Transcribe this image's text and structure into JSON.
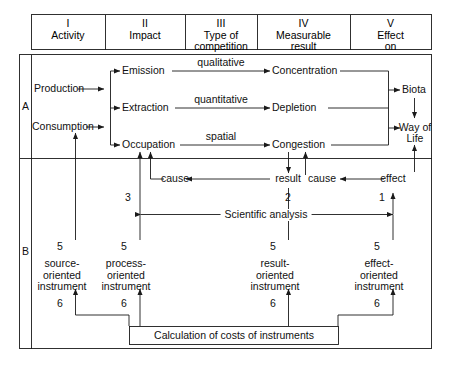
{
  "diagram": {
    "columns": [
      {
        "numeral": "I",
        "label": "Activity"
      },
      {
        "numeral": "II",
        "label": "Impact"
      },
      {
        "numeral": "III",
        "label": "Type of\ncompetition",
        "line1": "Type of",
        "line2": "competition"
      },
      {
        "numeral": "IV",
        "label": "Measurable\nresult",
        "line1": "Measurable",
        "line2": "result"
      },
      {
        "numeral": "V",
        "label": "Effect\non",
        "line1": "Effect",
        "line2": "on"
      }
    ],
    "sections": [
      {
        "key": "A",
        "label": "A"
      },
      {
        "key": "B",
        "label": "B"
      }
    ],
    "section_a": {
      "activities": [
        "Production",
        "Consumption"
      ],
      "impacts": [
        "Emission",
        "Extraction",
        "Occupation"
      ],
      "competition_types": [
        "qualitative",
        "quantitative",
        "spatial"
      ],
      "results": [
        "Concentration",
        "Depletion",
        "Congestion"
      ],
      "effects": [
        {
          "line1": "Biota",
          "line2": ""
        },
        {
          "line1": "Way of",
          "line2": "Life"
        }
      ]
    },
    "section_b": {
      "chain": [
        {
          "label": "cause",
          "column": "II"
        },
        {
          "label": "result",
          "column": "IV"
        },
        {
          "label": "cause",
          "column": "IV"
        },
        {
          "label": "effect",
          "column": "V"
        }
      ],
      "chain_numbers": [
        "3",
        "2",
        "1"
      ],
      "analysis_label": "Scientific analysis",
      "instrument_top_numbers": [
        "5",
        "5",
        "5",
        "5"
      ],
      "instrument_bottom_numbers": [
        "6",
        "6",
        "6",
        "6"
      ],
      "instruments": [
        {
          "line1": "source-",
          "line2": "oriented",
          "line3": "instrument"
        },
        {
          "line1": "process-",
          "line2": "oriented",
          "line3": "instrument"
        },
        {
          "line1": "result-",
          "line2": "oriented",
          "line3": "instrument"
        },
        {
          "line1": "effect-",
          "line2": "oriented",
          "line3": "instrument"
        }
      ],
      "calculation_box": "Calculation of costs of instruments"
    },
    "colors": {
      "line": "#1a1a1a",
      "text": "#111111",
      "background": "#ffffff"
    }
  }
}
